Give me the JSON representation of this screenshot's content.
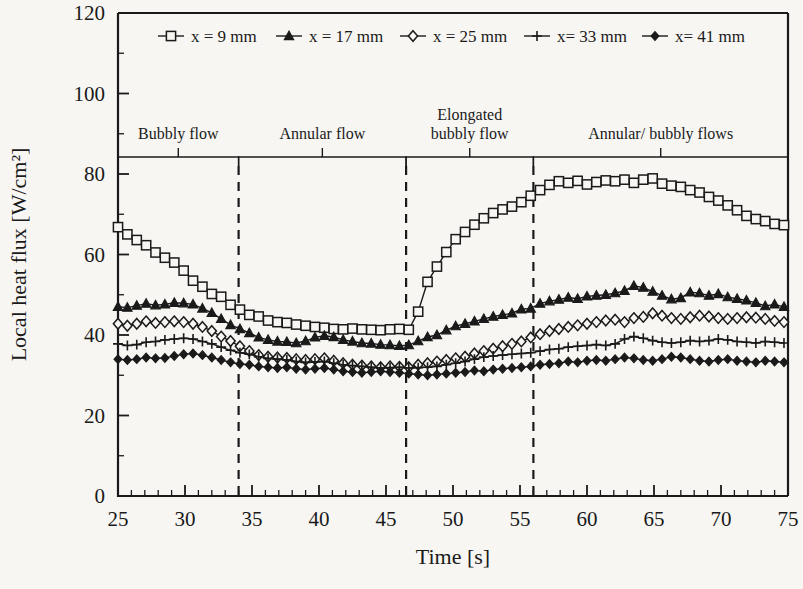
{
  "chart_data": {
    "type": "line",
    "title": "",
    "xlabel": "Time [s]",
    "ylabel": "Local heat flux [W/cm²]",
    "xlim": [
      25,
      75
    ],
    "ylim": [
      0,
      120
    ],
    "x_major_ticks": [
      25,
      30,
      35,
      40,
      45,
      50,
      55,
      60,
      65,
      70,
      75
    ],
    "x_tick_labels": [
      "25",
      "30",
      "35",
      "40",
      "45",
      "50",
      "55",
      "60",
      "65",
      "70",
      "75"
    ],
    "x_minor_step": 1,
    "y_major_ticks": [
      0,
      20,
      40,
      60,
      80,
      100,
      120
    ],
    "y_tick_labels": [
      "0",
      "20",
      "40",
      "60",
      "80",
      "100",
      "120"
    ],
    "y_minor_step": 10,
    "grid": false,
    "legend_position": "top-inside",
    "x": [
      25.0,
      25.7,
      26.4,
      27.1,
      27.8,
      28.5,
      29.2,
      29.9,
      30.6,
      31.3,
      32.0,
      32.7,
      33.4,
      34.1,
      34.8,
      35.5,
      36.2,
      36.9,
      37.6,
      38.3,
      39.0,
      39.7,
      40.4,
      41.1,
      41.8,
      42.5,
      43.2,
      43.9,
      44.6,
      45.3,
      46.0,
      46.7,
      47.4,
      48.1,
      48.8,
      49.5,
      50.2,
      50.9,
      51.6,
      52.3,
      53.0,
      53.7,
      54.4,
      55.1,
      55.8,
      56.5,
      57.2,
      57.9,
      58.6,
      59.3,
      60.0,
      60.7,
      61.4,
      62.1,
      62.8,
      63.5,
      64.2,
      64.9,
      65.6,
      66.3,
      67.0,
      67.7,
      68.4,
      69.1,
      69.8,
      70.5,
      71.2,
      71.9,
      72.6,
      73.3,
      74.0,
      74.7
    ],
    "series": [
      {
        "name": "x = 9 mm",
        "marker": "open-square",
        "values": [
          66.8,
          65.0,
          63.6,
          62.3,
          60.5,
          59.2,
          58.0,
          56.0,
          53.5,
          52.0,
          50.2,
          49.5,
          47.5,
          46.3,
          45.0,
          44.6,
          43.6,
          43.2,
          43.0,
          42.6,
          42.3,
          42.0,
          41.8,
          41.5,
          41.4,
          41.6,
          41.4,
          41.3,
          41.2,
          41.4,
          41.5,
          41.3,
          45.8,
          53.2,
          57.0,
          60.6,
          63.8,
          65.6,
          67.4,
          69.0,
          70.3,
          71.2,
          71.9,
          73.0,
          74.6,
          76.0,
          77.3,
          78.2,
          77.8,
          78.3,
          77.4,
          78.0,
          78.4,
          78.2,
          78.6,
          77.8,
          78.6,
          78.9,
          77.6,
          77.1,
          76.8,
          76.0,
          75.4,
          74.3,
          73.4,
          72.2,
          71.0,
          69.6,
          68.8,
          68.3,
          67.6,
          67.3
        ]
      },
      {
        "name": "x = 17 mm",
        "marker": "filled-triangle",
        "values": [
          47.0,
          46.8,
          47.3,
          47.8,
          47.4,
          47.6,
          48.0,
          47.9,
          47.6,
          46.6,
          45.5,
          44.0,
          42.5,
          41.5,
          40.5,
          39.4,
          38.8,
          38.4,
          38.3,
          38.0,
          38.5,
          39.4,
          39.8,
          39.5,
          38.8,
          38.4,
          38.0,
          37.9,
          37.6,
          37.5,
          37.3,
          37.5,
          38.5,
          39.5,
          40.0,
          41.2,
          42.2,
          42.8,
          43.4,
          44.0,
          44.6,
          45.0,
          45.4,
          46.4,
          46.6,
          47.8,
          48.4,
          48.8,
          49.3,
          49.0,
          49.6,
          49.8,
          50.0,
          50.4,
          51.0,
          52.2,
          51.8,
          50.8,
          49.8,
          48.9,
          49.2,
          50.6,
          50.4,
          49.8,
          50.2,
          49.4,
          49.0,
          48.6,
          48.0,
          47.2,
          47.6,
          47.0
        ]
      },
      {
        "name": "x = 25 mm",
        "marker": "open-diamond",
        "values": [
          42.8,
          42.3,
          42.8,
          43.4,
          43.0,
          43.2,
          43.4,
          43.2,
          42.8,
          42.0,
          41.0,
          39.6,
          38.5,
          37.2,
          36.0,
          35.0,
          34.6,
          34.4,
          34.3,
          34.0,
          33.8,
          34.0,
          34.2,
          33.6,
          33.0,
          32.6,
          32.4,
          32.2,
          32.0,
          32.2,
          32.1,
          32.0,
          32.6,
          33.0,
          33.4,
          33.8,
          34.2,
          34.6,
          35.4,
          36.0,
          36.6,
          37.2,
          37.8,
          38.4,
          39.4,
          40.2,
          41.0,
          41.5,
          42.0,
          42.4,
          42.8,
          43.2,
          43.6,
          43.8,
          43.2,
          44.2,
          44.5,
          45.4,
          44.8,
          44.2,
          44.0,
          44.4,
          44.8,
          44.6,
          44.2,
          44.0,
          44.2,
          44.4,
          44.3,
          44.0,
          43.5,
          43.2
        ]
      },
      {
        "name": "x= 33 mm",
        "marker": "plus",
        "values": [
          37.8,
          37.4,
          37.6,
          38.2,
          38.4,
          38.8,
          39.0,
          39.2,
          39.0,
          38.4,
          37.8,
          37.0,
          36.2,
          35.6,
          35.2,
          34.6,
          34.2,
          34.0,
          33.8,
          33.4,
          33.2,
          33.3,
          33.4,
          33.0,
          32.6,
          32.4,
          32.2,
          32.0,
          31.8,
          31.9,
          32.0,
          31.8,
          31.9,
          32.0,
          32.2,
          32.6,
          33.0,
          33.4,
          34.0,
          34.5,
          34.8,
          35.0,
          35.2,
          35.4,
          35.6,
          36.0,
          36.4,
          36.6,
          37.0,
          37.2,
          37.4,
          37.6,
          37.4,
          37.8,
          39.0,
          39.6,
          39.2,
          38.6,
          38.2,
          38.0,
          38.2,
          38.6,
          38.4,
          38.6,
          39.0,
          38.8,
          38.4,
          38.2,
          38.0,
          38.4,
          38.2,
          38.0
        ]
      },
      {
        "name": "x= 41 mm",
        "marker": "filled-diamond",
        "values": [
          34.0,
          33.8,
          34.0,
          34.4,
          34.2,
          34.3,
          34.8,
          35.2,
          35.4,
          35.0,
          34.4,
          33.8,
          33.2,
          32.8,
          32.6,
          32.2,
          32.0,
          31.8,
          32.0,
          31.6,
          31.4,
          31.6,
          31.8,
          31.4,
          31.0,
          30.8,
          30.6,
          30.8,
          31.0,
          30.8,
          30.6,
          30.4,
          30.2,
          30.0,
          30.2,
          30.4,
          30.6,
          30.8,
          31.2,
          31.0,
          31.4,
          31.6,
          31.8,
          32.0,
          32.2,
          32.6,
          32.8,
          33.0,
          33.4,
          33.2,
          33.6,
          33.8,
          33.6,
          34.0,
          34.4,
          34.2,
          33.8,
          33.6,
          34.0,
          34.6,
          34.4,
          34.0,
          33.6,
          33.4,
          33.8,
          34.0,
          33.6,
          33.4,
          33.2,
          33.6,
          33.4,
          33.2
        ]
      }
    ],
    "dividers": [
      34.0,
      46.5,
      56.0
    ],
    "regimes": [
      {
        "label": "Bubbly flow",
        "start": 25.0,
        "end": 34.0,
        "lines": [
          "Bubbly flow"
        ]
      },
      {
        "label": "Annular flow",
        "start": 34.0,
        "end": 46.5,
        "lines": [
          "Annular flow"
        ]
      },
      {
        "label": "Elongated bubbly flow",
        "start": 46.5,
        "end": 56.0,
        "lines": [
          "Elongated",
          "bubbly flow"
        ]
      },
      {
        "label": "Annular/ bubbly flows",
        "start": 56.0,
        "end": 75.0,
        "lines": [
          "Annular/ bubbly flows"
        ]
      }
    ]
  },
  "legend": {
    "items": [
      {
        "label": "x = 9 mm",
        "marker": "open-square"
      },
      {
        "label": "x = 17 mm",
        "marker": "filled-triangle"
      },
      {
        "label": "x = 25 mm",
        "marker": "open-diamond"
      },
      {
        "label": "x= 33 mm",
        "marker": "plus"
      },
      {
        "label": "x= 41 mm",
        "marker": "filled-diamond"
      }
    ]
  }
}
